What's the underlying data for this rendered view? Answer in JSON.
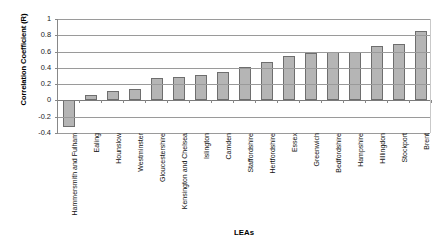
{
  "chart_data": {
    "type": "bar",
    "title": "",
    "xlabel": "LEAs",
    "ylabel": "Correlation Coefficient (R)",
    "ylim": [
      -0.4,
      1
    ],
    "ytick_labels": [
      "1",
      "0.8",
      "0.6",
      "0.4",
      "0.2",
      "0",
      "-0.2",
      "-0.4"
    ],
    "ytick_values": [
      1,
      0.8,
      0.6,
      0.4,
      0.2,
      0,
      -0.2,
      -0.4
    ],
    "grid": true,
    "legend": "none",
    "categories": [
      "Hammersmith and Fulham",
      "Ealing",
      "Hounslow",
      "Westminster",
      "Gloucestershire",
      "Kensington and Chelsea",
      "Islington",
      "Camden",
      "Staffordshire",
      "Hertfordshire",
      "Essex",
      "Greenwich",
      "Bedfordshire",
      "Hampshire",
      "Hillingdon",
      "Stockport",
      "Brent"
    ],
    "values": [
      -0.33,
      0.07,
      0.11,
      0.14,
      0.28,
      0.29,
      0.31,
      0.35,
      0.41,
      0.47,
      0.55,
      0.58,
      0.6,
      0.6,
      0.67,
      0.69,
      0.85
    ],
    "bar_fill_color": "#b5b5b5",
    "bar_border_color": "#6e6e6e",
    "gridline_color": "#9a9a9a",
    "axis_color": "#888888"
  }
}
